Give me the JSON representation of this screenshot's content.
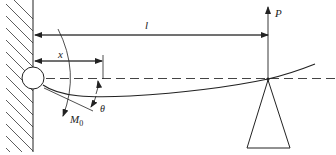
{
  "diagram": {
    "type": "beam-mechanics",
    "labels": {
      "length": "l",
      "position": "x",
      "force": "P",
      "moment": "M",
      "moment_subscript": "0",
      "angle": "θ"
    },
    "colors": {
      "line": "#222222",
      "dashed": "#444444",
      "background": "#ffffff"
    }
  }
}
